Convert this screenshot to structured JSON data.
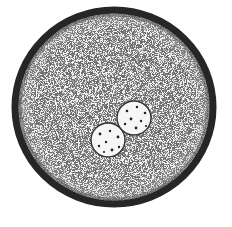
{
  "image": {
    "subject": "stippled illustration of a single round cell containing two small nuclei",
    "background": "#ffffff",
    "outer_cell": {
      "cx": 114,
      "cy": 107,
      "rx": 99,
      "ry": 97,
      "border_color": "#2a2a2a",
      "border_width": 7,
      "fill": "#f2f2f2"
    },
    "nuclei": [
      {
        "cx": 108,
        "cy": 140,
        "r": 17
      },
      {
        "cx": 134,
        "cy": 118,
        "r": 17
      }
    ],
    "stipple_color": "#555555"
  }
}
